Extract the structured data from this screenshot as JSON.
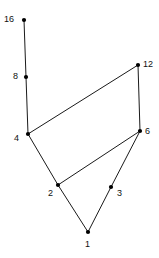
{
  "figure": {
    "type": "node-link-diagram",
    "background_color": "#ffffff",
    "edge_color": "#1a1a1a",
    "node_color": "#000000",
    "label_color": "#111111",
    "width": 159,
    "height": 258
  },
  "graph_data": {
    "type": "graph",
    "title": "",
    "nodes": [
      {
        "id": "16",
        "label": "16",
        "x": 24,
        "y": 20,
        "label_x": 4,
        "label_y": 15,
        "label_anchor": "left"
      },
      {
        "id": "8",
        "label": "8",
        "x": 26,
        "y": 77,
        "label_x": 13,
        "label_y": 72,
        "label_anchor": "left"
      },
      {
        "id": "4",
        "label": "4",
        "x": 28,
        "y": 134,
        "label_x": 14,
        "label_y": 134,
        "label_anchor": "left"
      },
      {
        "id": "12",
        "label": "12",
        "x": 138,
        "y": 65,
        "label_x": 143,
        "label_y": 60,
        "label_anchor": "right"
      },
      {
        "id": "6",
        "label": "6",
        "x": 140,
        "y": 131,
        "label_x": 145,
        "label_y": 127,
        "label_anchor": "right"
      },
      {
        "id": "2",
        "label": "2",
        "x": 58,
        "y": 185,
        "label_x": 48,
        "label_y": 189,
        "label_anchor": "left"
      },
      {
        "id": "3",
        "label": "3",
        "x": 111,
        "y": 187,
        "label_x": 117,
        "label_y": 189,
        "label_anchor": "right"
      },
      {
        "id": "1",
        "label": "1",
        "x": 88,
        "y": 232,
        "label_x": 85,
        "label_y": 240,
        "label_anchor": "below"
      }
    ],
    "edges": [
      {
        "from": "16",
        "to": "8"
      },
      {
        "from": "8",
        "to": "4"
      },
      {
        "from": "4",
        "to": "12"
      },
      {
        "from": "12",
        "to": "6"
      },
      {
        "from": "4",
        "to": "2"
      },
      {
        "from": "2",
        "to": "6"
      },
      {
        "from": "2",
        "to": "1"
      },
      {
        "from": "1",
        "to": "3"
      },
      {
        "from": "3",
        "to": "6"
      }
    ],
    "node_radius": 2.1,
    "edge_width": 1
  }
}
